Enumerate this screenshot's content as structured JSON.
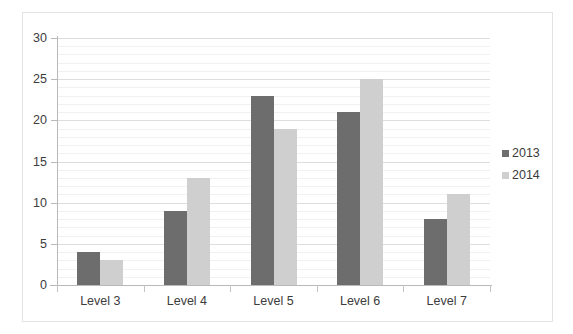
{
  "chart_data": {
    "type": "bar",
    "title": "",
    "subtitle": "",
    "xlabel": "",
    "ylabel": "",
    "categories": [
      "Level 3",
      "Level 4",
      "Level 5",
      "Level 6",
      "Level 7"
    ],
    "series": [
      {
        "name": "2013",
        "color": "#6d6d6d",
        "values": [
          4,
          9,
          23,
          21,
          8
        ]
      },
      {
        "name": "2014",
        "color": "#cfcfcf",
        "values": [
          3,
          13,
          19,
          25,
          11
        ]
      }
    ],
    "ylim": [
      0,
      30
    ],
    "y_ticks": [
      0,
      5,
      10,
      15,
      20,
      25,
      30
    ],
    "y_tick_labels": [
      "0",
      "5",
      "10",
      "15",
      "20",
      "25",
      "30"
    ],
    "minor_gridline_step": 1,
    "grid": "horizontal",
    "legend_position": "right",
    "annotations": []
  },
  "legend": {
    "entries": [
      {
        "label": "2013",
        "swatch": "legend-swatch-2013"
      },
      {
        "label": "2014",
        "swatch": "legend-swatch-2014"
      }
    ]
  },
  "colors": {
    "series_2013": "#6d6d6d",
    "series_2014": "#cfcfcf",
    "axis": "#b9b9b9",
    "gridline_minor": "#f1f1f1",
    "gridline_major": "#dedede",
    "text": "#3c3c3c",
    "frame": "#e3e3e3",
    "background": "#ffffff"
  }
}
